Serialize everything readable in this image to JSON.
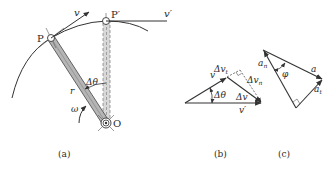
{
  "figure": {
    "panels": [
      {
        "id": "a",
        "caption": "(a)"
      },
      {
        "id": "b",
        "caption": "(b)"
      },
      {
        "id": "c",
        "caption": "(c)"
      }
    ]
  },
  "panel_a": {
    "point_p": "P",
    "point_p_prime": "P′",
    "point_o": "O",
    "velocity_v": "v",
    "velocity_v_prime": "v′",
    "radius": "r",
    "angle": "Δθ",
    "angular_velocity": "ω"
  },
  "panel_b": {
    "v": "v",
    "v_prime": "v′",
    "delta_theta": "Δθ",
    "delta_v": "Δv",
    "delta_v_t": "Δv",
    "delta_v_t_sub": "t",
    "delta_v_n": "Δv",
    "delta_v_n_sub": "n"
  },
  "panel_c": {
    "a": "a",
    "a_n": "a",
    "a_n_sub": "n",
    "a_t": "a",
    "a_t_sub": "t",
    "phi": "φ"
  },
  "colors": {
    "line": "#333333",
    "rod_fill": "#b5b5b5",
    "background": "#ffffff"
  }
}
